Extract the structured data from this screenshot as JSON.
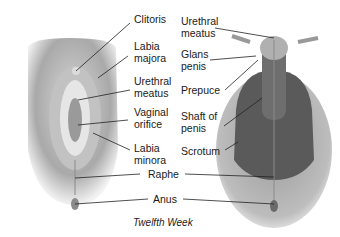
{
  "diagram": {
    "caption": "Twelfth Week",
    "left_figure": {
      "name": "female",
      "labels": [
        "Clitoris",
        "Labia\nmajora",
        "Urethral\nmeatus",
        "Vaginal\norifice",
        "Labia\nminora"
      ]
    },
    "right_figure": {
      "name": "male",
      "labels": [
        "Urethral\nmeatus",
        "Glans\npenis",
        "Prepuce",
        "Shaft of\npenis",
        "Scrotum"
      ]
    },
    "shared_labels": [
      "Raphe",
      "Anus"
    ]
  }
}
